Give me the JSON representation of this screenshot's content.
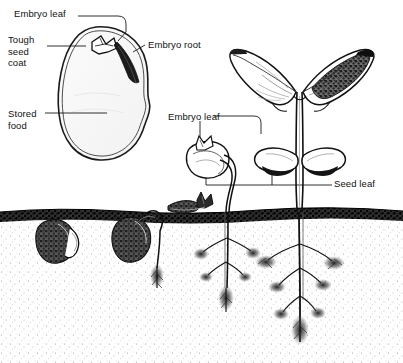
{
  "figure": {
    "background_color": "#ffffff",
    "ink_color": "#111111",
    "soil_color": "#2b2b2b"
  },
  "labels": {
    "embryo_leaf_seed": "Embryo leaf",
    "tough_seed_coat": "Tough\nseed\ncoat",
    "stored_food": "Stored\nfood",
    "embryo_root": "Embryo root",
    "embryo_leaf_seedling": "Embryo leaf",
    "seed_leaf": "Seed leaf"
  },
  "parts": {
    "seed_cutaway": "bean-seed-cutaway",
    "seed_coat": "tough-seed-coat-outline",
    "stored_food_region": "cotyledon-stored-food",
    "embryo_leaf_tip": "embryo-leaf-plumule",
    "embryo_root_tip": "embryo-root-radicle",
    "buried_seed_left": "germinating-seed-stage-1",
    "buried_seed_middle": "germinating-seed-stage-2",
    "emerging_shoot": "emerging-shoot-stage-3",
    "young_seedling": "young-seedling-stage-4",
    "mature_seedling": "mature-seedling-stage-5",
    "soil_line": "soil-surface-line",
    "taproot_young": "taproot-young-seedling",
    "taproot_mature": "branching-taproot-mature-seedling",
    "true_leaves": "true-leaves-pair",
    "seed_leaves": "seed-leaves-cotyledons"
  },
  "stages": [
    {
      "name": "seed-cutaway",
      "caption": "Embryo leaf"
    },
    {
      "name": "seed-cutaway",
      "caption": "Tough seed coat"
    },
    {
      "name": "seed-cutaway",
      "caption": "Stored food"
    },
    {
      "name": "seed-cutaway",
      "caption": "Embryo root"
    },
    {
      "name": "seedling",
      "caption": "Embryo leaf"
    },
    {
      "name": "seedling",
      "caption": "Seed leaf"
    }
  ]
}
